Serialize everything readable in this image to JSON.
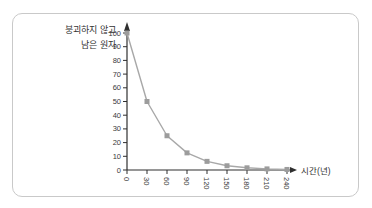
{
  "card": {
    "border_color": "#c9c9c9",
    "background": "#ffffff"
  },
  "labels": {
    "y_axis_line1": "붕괴하지 않고",
    "y_axis_line2": "남은 원자",
    "x_axis": "시간(년)"
  },
  "chart_data": {
    "type": "line",
    "title": "",
    "xlabel": "시간(년)",
    "ylabel": "붕괴하지 않고 남은 원자",
    "x": [
      0,
      30,
      60,
      90,
      120,
      150,
      180,
      210,
      240
    ],
    "values": [
      100,
      50,
      25,
      12.5,
      6.3,
      3.1,
      1.6,
      0.8,
      0.4
    ],
    "x_tick_labels": [
      "0",
      "30",
      "60",
      "90",
      "120",
      "150",
      "180",
      "210",
      "240"
    ],
    "y_ticks": [
      0,
      10,
      20,
      30,
      40,
      50,
      60,
      70,
      80,
      90,
      100
    ],
    "xlim": [
      0,
      255
    ],
    "ylim": [
      0,
      105
    ],
    "grid": false,
    "legend": "none",
    "marker": "square",
    "line_color": "#a8a8a8",
    "marker_color": "#9c9c9c",
    "axis_color": "#2f2f2f",
    "tick_text_color": "#3a3a3a"
  }
}
